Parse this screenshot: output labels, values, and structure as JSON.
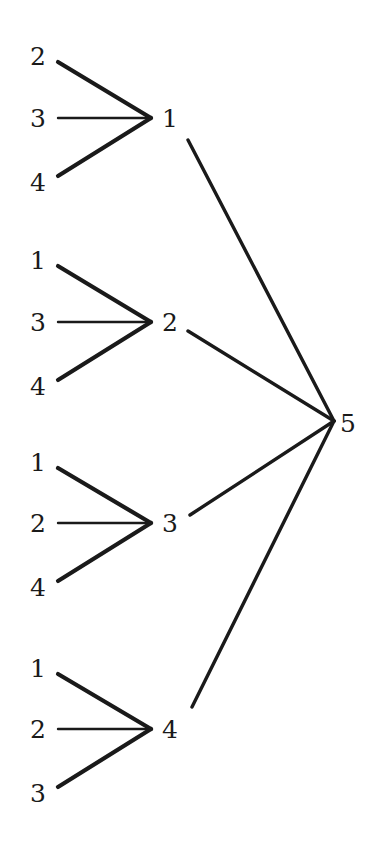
{
  "figure": {
    "kind": "tree-diagram",
    "background_color": "#ffffff",
    "ink_color": "#1a1a1a",
    "width": 384,
    "height": 852
  },
  "root": {
    "label": "5",
    "x": 348,
    "y": 423,
    "junction_x": 334,
    "junction_y": 421
  },
  "groups": [
    {
      "mid": {
        "label": "1",
        "x": 170,
        "y": 118,
        "junction_x": 151,
        "junction_y": 118
      },
      "leaves": [
        {
          "label": "2",
          "x": 38,
          "y": 56,
          "line_start_x": 58,
          "line_start_y": 62
        },
        {
          "label": "3",
          "x": 38,
          "y": 118,
          "line_start_x": 58,
          "line_start_y": 118
        },
        {
          "label": "4",
          "x": 38,
          "y": 182,
          "line_start_x": 58,
          "line_start_y": 176
        }
      ],
      "trunk": {
        "start_x": 188,
        "start_y": 140
      }
    },
    {
      "mid": {
        "label": "2",
        "x": 170,
        "y": 322,
        "junction_x": 151,
        "junction_y": 322
      },
      "leaves": [
        {
          "label": "1",
          "x": 38,
          "y": 260,
          "line_start_x": 58,
          "line_start_y": 266
        },
        {
          "label": "3",
          "x": 38,
          "y": 322,
          "line_start_x": 58,
          "line_start_y": 322
        },
        {
          "label": "4",
          "x": 38,
          "y": 386,
          "line_start_x": 58,
          "line_start_y": 380
        }
      ],
      "trunk": {
        "start_x": 188,
        "start_y": 331
      }
    },
    {
      "mid": {
        "label": "3",
        "x": 170,
        "y": 523,
        "junction_x": 151,
        "junction_y": 523
      },
      "leaves": [
        {
          "label": "1",
          "x": 38,
          "y": 462,
          "line_start_x": 58,
          "line_start_y": 468
        },
        {
          "label": "2",
          "x": 38,
          "y": 523,
          "line_start_x": 58,
          "line_start_y": 523
        },
        {
          "label": "4",
          "x": 38,
          "y": 587,
          "line_start_x": 58,
          "line_start_y": 581
        }
      ],
      "trunk": {
        "start_x": 190,
        "start_y": 515
      }
    },
    {
      "mid": {
        "label": "4",
        "x": 170,
        "y": 729,
        "junction_x": 151,
        "junction_y": 729
      },
      "leaves": [
        {
          "label": "1",
          "x": 38,
          "y": 668,
          "line_start_x": 58,
          "line_start_y": 674
        },
        {
          "label": "2",
          "x": 38,
          "y": 729,
          "line_start_x": 58,
          "line_start_y": 729
        },
        {
          "label": "3",
          "x": 38,
          "y": 793,
          "line_start_x": 58,
          "line_start_y": 787
        }
      ],
      "trunk": {
        "start_x": 192,
        "start_y": 707
      }
    }
  ],
  "stroke": {
    "diagonal_width": 4.2,
    "horizontal_width": 2.4,
    "trunk_width": 3.4
  }
}
